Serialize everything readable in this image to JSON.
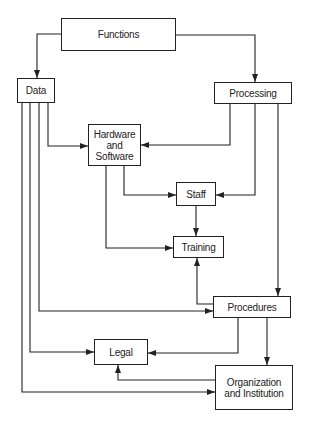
{
  "diagram": {
    "nodes": [
      {
        "id": "functions",
        "label": "Functions",
        "box": [
          61,
          18,
          115,
          33
        ]
      },
      {
        "id": "data",
        "label": "Data",
        "box": [
          17,
          78,
          38,
          25
        ]
      },
      {
        "id": "processing",
        "label": "Processing",
        "box": [
          214,
          82,
          78,
          22
        ]
      },
      {
        "id": "hardware",
        "label": "Hardware\nand\nSoftware",
        "box": [
          88,
          124,
          53,
          42
        ]
      },
      {
        "id": "staff",
        "label": "Staff",
        "box": [
          176,
          182,
          40,
          24
        ]
      },
      {
        "id": "training",
        "label": "Training",
        "box": [
          173,
          236,
          51,
          22
        ]
      },
      {
        "id": "procedures",
        "label": "Procedures",
        "box": [
          213,
          296,
          78,
          22
        ]
      },
      {
        "id": "legal",
        "label": "Legal",
        "box": [
          94,
          339,
          54,
          26
        ]
      },
      {
        "id": "organization",
        "label": "Organization\nand Institution",
        "box": [
          215,
          365,
          78,
          45
        ]
      }
    ],
    "edges": [
      {
        "from": "functions",
        "to": "data"
      },
      {
        "from": "functions",
        "to": "processing"
      },
      {
        "from": "data",
        "to": "hardware"
      },
      {
        "from": "processing",
        "to": "hardware"
      },
      {
        "from": "hardware",
        "to": "staff"
      },
      {
        "from": "processing",
        "to": "staff"
      },
      {
        "from": "hardware",
        "to": "training"
      },
      {
        "from": "staff",
        "to": "training"
      },
      {
        "from": "procedures",
        "to": "training"
      },
      {
        "from": "processing",
        "to": "procedures"
      },
      {
        "from": "data",
        "to": "procedures"
      },
      {
        "from": "data",
        "to": "legal"
      },
      {
        "from": "procedures",
        "to": "legal"
      },
      {
        "from": "procedures",
        "to": "organization"
      },
      {
        "from": "organization",
        "to": "legal"
      },
      {
        "from": "data",
        "to": "organization"
      }
    ],
    "colors": {
      "line": "#222222",
      "background": "#ffffff"
    }
  }
}
